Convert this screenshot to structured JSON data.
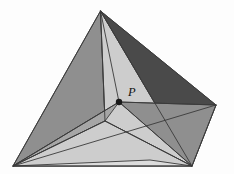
{
  "figure": {
    "name": "tetrahedron-with-interior-point",
    "background_color": "#fdfdfd",
    "stroke_color": "#3a3a3a",
    "canvas": {
      "width": 234,
      "height": 174
    },
    "labels": {
      "interior_point": "P"
    },
    "vertices": {
      "apex": {
        "name": "A",
        "x": 100.5,
        "y": 11
      },
      "bottom_left": {
        "name": "B",
        "x": 13,
        "y": 166
      },
      "bottom_right": {
        "name": "C",
        "x": 192,
        "y": 166
      },
      "right": {
        "name": "D",
        "x": 216,
        "y": 105
      },
      "interior": {
        "name": "P",
        "x": 119,
        "y": 102
      }
    },
    "label_positions": {
      "P": {
        "x": 128,
        "y": 96
      }
    },
    "point_marker": {
      "radius": 3.2,
      "color": "#1a1a1a"
    },
    "palette": {
      "dark": "#4a4a4a",
      "mid_dark": "#7d7d7d",
      "mid": "#8f8f8f",
      "mid_light": "#a6a6a6",
      "light": "#bfbfbf",
      "lighter": "#cdcdcd",
      "lightest": "#dcdcdc"
    },
    "faces": [
      {
        "name": "left-outer-face",
        "points": "100.5,11 13,166 119,102",
        "fill": "#8f8f8f"
      },
      {
        "name": "apex-p-sliver-left",
        "points": "100.5,11 119,102 105,121",
        "fill": "#bfbfbf"
      },
      {
        "name": "apex-p-sliver-right",
        "points": "100.5,11 105,121 192,166",
        "fill": "#cdcdcd"
      },
      {
        "name": "top-right-dark-face",
        "points": "100.5,11 192,166 216,105",
        "fill": "#4a4a4a"
      },
      {
        "name": "right-lower-face",
        "points": "119,102 216,105 192,166",
        "fill": "#8f8f8f"
      },
      {
        "name": "bottom-left-wedge",
        "points": "13,166 119,102 105,121",
        "fill": "#a6a6a6"
      },
      {
        "name": "bottom-mid-band",
        "points": "13,166 105,121 192,166",
        "fill": "#cdcdcd"
      },
      {
        "name": "bottom-base-strip",
        "points": "13,166 192,166 150,160",
        "fill": "#dcdcdc"
      }
    ],
    "edges": [
      {
        "name": "edge-apex-to-bottom-left",
        "d": "M100.5,11 L13,166"
      },
      {
        "name": "edge-apex-to-bottom-right",
        "d": "M100.5,11 L192,166"
      },
      {
        "name": "edge-apex-to-right",
        "d": "M100.5,11 L216,105"
      },
      {
        "name": "edge-bottom-left-to-right",
        "d": "M13,166 L192,166"
      },
      {
        "name": "edge-bottom-right-to-right",
        "d": "M192,166 L216,105"
      },
      {
        "name": "edge-apex-to-p",
        "d": "M100.5,11 L119,102"
      },
      {
        "name": "edge-p-to-bottom-left",
        "d": "M119,102 L13,166"
      },
      {
        "name": "edge-p-to-bottom-right",
        "d": "M119,102 L192,166"
      },
      {
        "name": "edge-p-to-right",
        "d": "M119,102 L216,105"
      },
      {
        "name": "edge-apex-to-base-interior",
        "d": "M100.5,11 L105,121"
      },
      {
        "name": "edge-base-interior-to-left",
        "d": "M105,121 L13,166"
      },
      {
        "name": "edge-base-interior-to-br",
        "d": "M105,121 L192,166"
      },
      {
        "name": "edge-right-to-bottom-left",
        "d": "M216,105 L13,166"
      }
    ]
  }
}
